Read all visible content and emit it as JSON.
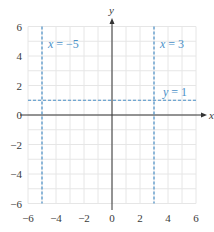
{
  "chart_data": {
    "type": "line",
    "title": "",
    "xlabel": "x",
    "ylabel": "y",
    "xlim": [
      -6,
      6
    ],
    "ylim": [
      -6,
      6
    ],
    "grid": true,
    "grid_step": 1,
    "x_ticks": [
      -6,
      -4,
      -2,
      0,
      2,
      4,
      6
    ],
    "y_ticks": [
      -6,
      -4,
      -2,
      0,
      2,
      4,
      6
    ],
    "x_tick_labels": [
      "−6",
      "−4",
      "−2",
      "0",
      "2",
      "4",
      "6"
    ],
    "y_tick_labels": [
      "−6",
      "−4",
      "−2",
      "0",
      "2",
      "4",
      "6"
    ],
    "series": [
      {
        "name": "x = −5",
        "kind": "vertical",
        "value": -5,
        "style": "dashed",
        "color": "#4a90c8",
        "label_var": "x",
        "label_rest": " = −5"
      },
      {
        "name": "x = 3",
        "kind": "vertical",
        "value": 3,
        "style": "dashed",
        "color": "#4a90c8",
        "label_var": "x",
        "label_rest": " = 3"
      },
      {
        "name": "y = 1",
        "kind": "horizontal",
        "value": 1,
        "style": "dashed",
        "color": "#4a90c8",
        "label_var": "y",
        "label_rest": " = 1"
      }
    ]
  },
  "colors": {
    "line": "#4a90c8",
    "axis": "#333333",
    "grid": "#e6e6e6",
    "text": "#3a3a3a"
  }
}
